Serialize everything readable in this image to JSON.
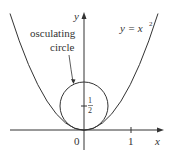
{
  "figure": {
    "curve_label": "y = x",
    "curve_exponent": "2",
    "annotation": {
      "line1": "osculating",
      "line2": "circle"
    },
    "axes": {
      "x_label": "x",
      "y_label": "y",
      "origin_label": "0",
      "x_tick_label": "1"
    },
    "center_label": {
      "numerator": "1",
      "denominator": "2"
    }
  }
}
